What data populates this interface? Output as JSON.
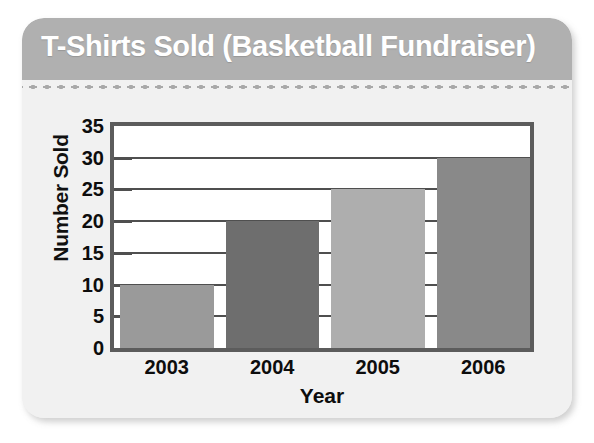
{
  "card": {
    "title": "T-Shirts Sold (Basketball Fundraiser)",
    "header_bg": "#b0b0b0",
    "body_bg": "#f1f1f1",
    "title_color": "#ffffff"
  },
  "chart_data": {
    "type": "bar",
    "title": "T-Shirts Sold (Basketball Fundraiser)",
    "categories": [
      "2003",
      "2004",
      "2005",
      "2006"
    ],
    "values": [
      10,
      20,
      25,
      30
    ],
    "bar_colors": [
      "#9a9a9a",
      "#6e6e6e",
      "#aeaeae",
      "#898989"
    ],
    "xlabel": "Year",
    "ylabel": "Number Sold",
    "ylim": [
      0,
      35
    ],
    "ytick_labels": [
      "35",
      "30",
      "25",
      "20",
      "15",
      "10",
      "5",
      "0"
    ],
    "ytick_values": [
      35,
      30,
      25,
      20,
      15,
      10,
      5,
      0
    ],
    "ytick_step": 5,
    "grid": true,
    "grid_axis": "y",
    "legend": false,
    "plot_border_color": "#5c5c5c",
    "plot_bg": "#ffffff",
    "gridline_color": "#4f4f4f"
  }
}
